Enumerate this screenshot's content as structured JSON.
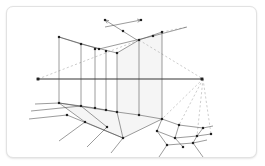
{
  "card": {
    "title": "Two-point perspective construction",
    "background_color": "#ffffff",
    "border_color": "#e2e2e2",
    "corner_radius_px": 7
  },
  "figure": {
    "type": "perspective-construction-diagram",
    "width": 249,
    "height": 150,
    "stroke_color": "#4a4a4a",
    "dashed_color": "#9b9b9b",
    "point_color": "#222222",
    "fill_color": "#ededed",
    "fill_opacity": 0.55,
    "horizon": {
      "label": "horizon-line",
      "y": 72,
      "x1": 30,
      "x2": 196
    },
    "vanishing_points": [
      {
        "name": "left-vanishing-point",
        "x": 31,
        "y": 72
      },
      {
        "name": "right-vanishing-point",
        "x": 195,
        "y": 72
      }
    ],
    "solid_lines": [
      [
        30,
        72,
        196,
        72
      ],
      [
        52,
        30,
        92,
        42
      ],
      [
        92,
        42,
        146,
        29
      ],
      [
        146,
        29,
        180,
        20
      ],
      [
        52,
        30,
        74,
        37
      ],
      [
        74,
        37,
        110,
        46
      ],
      [
        110,
        46,
        132,
        33
      ],
      [
        132,
        33,
        155,
        25
      ],
      [
        52,
        30,
        52,
        96
      ],
      [
        74,
        37,
        74,
        99
      ],
      [
        88,
        42,
        88,
        101
      ],
      [
        99,
        44,
        99,
        103
      ],
      [
        110,
        46,
        110,
        105
      ],
      [
        132,
        33,
        132,
        108
      ],
      [
        155,
        25,
        155,
        112
      ],
      [
        52,
        96,
        74,
        99
      ],
      [
        74,
        99,
        88,
        101
      ],
      [
        88,
        101,
        99,
        103
      ],
      [
        99,
        103,
        110,
        105
      ],
      [
        110,
        105,
        132,
        108
      ],
      [
        132,
        108,
        155,
        112
      ],
      [
        28,
        97,
        52,
        96
      ],
      [
        24,
        104,
        74,
        99
      ],
      [
        22,
        112,
        60,
        108
      ],
      [
        52,
        96,
        110,
        105
      ],
      [
        52,
        96,
        78,
        115
      ],
      [
        74,
        99,
        100,
        120
      ],
      [
        110,
        105,
        116,
        131
      ],
      [
        78,
        115,
        116,
        131
      ],
      [
        60,
        108,
        116,
        131
      ],
      [
        116,
        131,
        155,
        112
      ],
      [
        116,
        131,
        104,
        146
      ],
      [
        100,
        120,
        80,
        140
      ],
      [
        78,
        115,
        52,
        134
      ],
      [
        155,
        112,
        172,
        118
      ],
      [
        172,
        118,
        196,
        121
      ],
      [
        155,
        112,
        150,
        124
      ],
      [
        150,
        124,
        168,
        131
      ],
      [
        168,
        131,
        190,
        129
      ],
      [
        172,
        118,
        168,
        131
      ],
      [
        196,
        121,
        190,
        129
      ],
      [
        150,
        124,
        160,
        138
      ],
      [
        160,
        138,
        186,
        136
      ],
      [
        186,
        136,
        190,
        129
      ],
      [
        168,
        131,
        176,
        140
      ],
      [
        190,
        129,
        204,
        127
      ],
      [
        186,
        136,
        200,
        133
      ],
      [
        196,
        121,
        206,
        119
      ],
      [
        160,
        138,
        152,
        150
      ],
      [
        186,
        136,
        196,
        150
      ]
    ],
    "dashed_lines": [
      [
        31,
        72,
        132,
        33
      ],
      [
        132,
        33,
        196,
        72
      ],
      [
        196,
        72,
        155,
        112
      ],
      [
        196,
        72,
        172,
        118
      ],
      [
        196,
        72,
        190,
        129
      ],
      [
        196,
        72,
        204,
        127
      ],
      [
        155,
        25,
        180,
        20
      ]
    ],
    "arrows": [
      {
        "name": "arrow-up-left",
        "x1": 130,
        "y1": 33,
        "x2": 98,
        "y2": 13
      },
      {
        "name": "arrow-up-right",
        "x1": 98,
        "y1": 20,
        "x2": 134,
        "y2": 13
      }
    ],
    "points": [
      [
        31,
        72
      ],
      [
        195,
        72
      ],
      [
        52,
        30
      ],
      [
        74,
        37
      ],
      [
        88,
        42
      ],
      [
        99,
        44
      ],
      [
        110,
        46
      ],
      [
        132,
        33
      ],
      [
        155,
        25
      ],
      [
        92,
        42
      ],
      [
        146,
        29
      ],
      [
        52,
        96
      ],
      [
        74,
        99
      ],
      [
        88,
        101
      ],
      [
        99,
        103
      ],
      [
        110,
        105
      ],
      [
        132,
        108
      ],
      [
        155,
        112
      ],
      [
        78,
        115
      ],
      [
        100,
        120
      ],
      [
        60,
        108
      ],
      [
        116,
        131
      ],
      [
        150,
        124
      ],
      [
        168,
        131
      ],
      [
        172,
        118
      ],
      [
        190,
        129
      ],
      [
        196,
        121
      ],
      [
        160,
        138
      ],
      [
        186,
        136
      ],
      [
        204,
        127
      ],
      [
        176,
        140
      ],
      [
        98,
        13
      ],
      [
        134,
        13
      ],
      [
        116,
        24
      ]
    ],
    "filled_regions": [
      {
        "name": "right-wall-panel",
        "points": "110,46 132,33 132,108 110,105"
      },
      {
        "name": "far-wall-panel",
        "points": "132,33 155,25 155,112 132,108"
      },
      {
        "name": "ground-plane",
        "points": "52,96 110,105 116,131 78,115"
      },
      {
        "name": "ground-plane-right",
        "points": "110,105 155,112 116,131"
      }
    ]
  }
}
